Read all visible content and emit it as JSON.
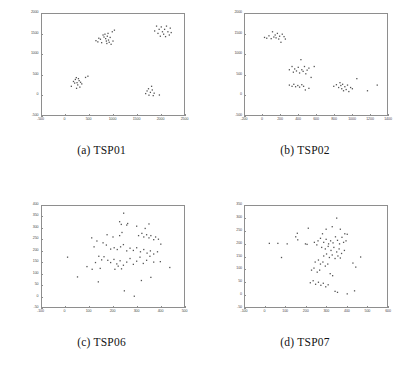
{
  "figure": {
    "background": "#ffffff",
    "point_color": "#555555",
    "frame_color": "#8e8e8e",
    "tick_label_color": "#4a4a4a"
  },
  "panels": [
    {
      "id": "a",
      "tag": "(a)",
      "name": "TSP01",
      "caption": "(a) TSP01"
    },
    {
      "id": "b",
      "tag": "(b)",
      "name": "TSP02",
      "caption": "(b) TSP02"
    },
    {
      "id": "c",
      "tag": "(c)",
      "name": "TSP06",
      "caption": "(c) TSP06"
    },
    {
      "id": "d",
      "tag": "(d)",
      "name": "TSP07",
      "caption": "(d) TSP07"
    }
  ],
  "chart_data": [
    {
      "type": "scatter",
      "title": "(a) TSP01",
      "xlabel": "",
      "ylabel": "",
      "xlim": [
        -500,
        2500
      ],
      "ylim": [
        -500,
        2000
      ],
      "xticks": [
        -500,
        0,
        500,
        1000,
        1500,
        2000,
        2500
      ],
      "yticks": [
        -500,
        0,
        500,
        1000,
        1500,
        2000
      ],
      "grid": false,
      "legend": "none",
      "n_points": 60,
      "points": [
        [
          640,
          1340
        ],
        [
          680,
          1310
        ],
        [
          700,
          1400
        ],
        [
          735,
          1375
        ],
        [
          760,
          1290
        ],
        [
          790,
          1480
        ],
        [
          810,
          1430
        ],
        [
          830,
          1500
        ],
        [
          845,
          1390
        ],
        [
          860,
          1330
        ],
        [
          870,
          1270
        ],
        [
          880,
          1450
        ],
        [
          895,
          1520
        ],
        [
          905,
          1355
        ],
        [
          920,
          1300
        ],
        [
          940,
          1420
        ],
        [
          960,
          1250
        ],
        [
          985,
          1560
        ],
        [
          1000,
          1330
        ],
        [
          1030,
          1600
        ],
        [
          1880,
          1580
        ],
        [
          1920,
          1700
        ],
        [
          1950,
          1520
        ],
        [
          1975,
          1620
        ],
        [
          2000,
          1450
        ],
        [
          2020,
          1680
        ],
        [
          2045,
          1560
        ],
        [
          2070,
          1500
        ],
        [
          2090,
          1620
        ],
        [
          2110,
          1440
        ],
        [
          2130,
          1700
        ],
        [
          2160,
          1560
        ],
        [
          2190,
          1480
        ],
        [
          2210,
          1650
        ],
        [
          2230,
          1540
        ],
        [
          120,
          210
        ],
        [
          165,
          330
        ],
        [
          190,
          290
        ],
        [
          205,
          380
        ],
        [
          225,
          425
        ],
        [
          240,
          300
        ],
        [
          255,
          245
        ],
        [
          270,
          400
        ],
        [
          285,
          350
        ],
        [
          300,
          190
        ],
        [
          315,
          310
        ],
        [
          340,
          270
        ],
        [
          420,
          430
        ],
        [
          470,
          460
        ],
        [
          230,
          160
        ],
        [
          1690,
          30
        ],
        [
          1720,
          95
        ],
        [
          1750,
          150
        ],
        [
          1760,
          -10
        ],
        [
          1790,
          60
        ],
        [
          1815,
          210
        ],
        [
          1830,
          120
        ],
        [
          1850,
          -20
        ],
        [
          1870,
          40
        ],
        [
          1980,
          -5
        ]
      ]
    },
    {
      "type": "scatter",
      "title": "(b) TSP02",
      "xlabel": "",
      "ylabel": "",
      "xlim": [
        -200,
        1400
      ],
      "ylim": [
        -500,
        2000
      ],
      "xticks": [
        -200,
        0,
        200,
        400,
        600,
        800,
        1000,
        1200,
        1400
      ],
      "yticks": [
        -500,
        0,
        500,
        1000,
        1500,
        2000
      ],
      "grid": false,
      "legend": "none",
      "n_points": 58,
      "points": [
        [
          20,
          1420
        ],
        [
          45,
          1400
        ],
        [
          70,
          1460
        ],
        [
          95,
          1390
        ],
        [
          110,
          1560
        ],
        [
          125,
          1430
        ],
        [
          140,
          1480
        ],
        [
          150,
          1410
        ],
        [
          165,
          1520
        ],
        [
          180,
          1380
        ],
        [
          190,
          1450
        ],
        [
          205,
          1300
        ],
        [
          220,
          1500
        ],
        [
          240,
          1440
        ],
        [
          255,
          1380
        ],
        [
          300,
          620
        ],
        [
          330,
          700
        ],
        [
          345,
          560
        ],
        [
          360,
          640
        ],
        [
          380,
          590
        ],
        [
          400,
          680
        ],
        [
          415,
          540
        ],
        [
          430,
          870
        ],
        [
          440,
          620
        ],
        [
          455,
          580
        ],
        [
          470,
          700
        ],
        [
          485,
          520
        ],
        [
          500,
          610
        ],
        [
          520,
          660
        ],
        [
          545,
          430
        ],
        [
          580,
          700
        ],
        [
          300,
          240
        ],
        [
          330,
          210
        ],
        [
          350,
          260
        ],
        [
          370,
          200
        ],
        [
          395,
          230
        ],
        [
          415,
          190
        ],
        [
          440,
          250
        ],
        [
          460,
          210
        ],
        [
          480,
          120
        ],
        [
          520,
          160
        ],
        [
          800,
          210
        ],
        [
          830,
          250
        ],
        [
          855,
          180
        ],
        [
          870,
          300
        ],
        [
          880,
          230
        ],
        [
          890,
          150
        ],
        [
          900,
          260
        ],
        [
          910,
          100
        ],
        [
          925,
          200
        ],
        [
          940,
          130
        ],
        [
          955,
          240
        ],
        [
          970,
          80
        ],
        [
          990,
          180
        ],
        [
          1010,
          150
        ],
        [
          1060,
          400
        ],
        [
          1180,
          100
        ],
        [
          1290,
          240
        ]
      ]
    },
    {
      "type": "scatter",
      "title": "(c) TSP06",
      "xlabel": "",
      "ylabel": "",
      "xlim": [
        -100,
        500
      ],
      "ylim": [
        -50,
        400
      ],
      "xticks": [
        -100,
        0,
        100,
        200,
        300,
        400,
        500
      ],
      "yticks": [
        -50,
        0,
        50,
        100,
        150,
        200,
        250,
        300,
        350,
        400
      ],
      "grid": false,
      "legend": "none",
      "n_points": 76,
      "points": [
        [
          245,
          368
        ],
        [
          228,
          330
        ],
        [
          235,
          318
        ],
        [
          258,
          315
        ],
        [
          262,
          322
        ],
        [
          300,
          310
        ],
        [
          352,
          320
        ],
        [
          175,
          272
        ],
        [
          200,
          262
        ],
        [
          228,
          268
        ],
        [
          238,
          282
        ],
        [
          308,
          268
        ],
        [
          322,
          278
        ],
        [
          330,
          262
        ],
        [
          342,
          272
        ],
        [
          352,
          258
        ],
        [
          360,
          268
        ],
        [
          372,
          250
        ],
        [
          380,
          262
        ],
        [
          392,
          252
        ],
        [
          336,
          300
        ],
        [
          110,
          258
        ],
        [
          132,
          244
        ],
        [
          120,
          218
        ],
        [
          158,
          236
        ],
        [
          172,
          226
        ],
        [
          190,
          208
        ],
        [
          205,
          214
        ],
        [
          218,
          206
        ],
        [
          232,
          218
        ],
        [
          244,
          228
        ],
        [
          258,
          200
        ],
        [
          272,
          212
        ],
        [
          286,
          202
        ],
        [
          300,
          214
        ],
        [
          316,
          196
        ],
        [
          330,
          206
        ],
        [
          344,
          190
        ],
        [
          358,
          200
        ],
        [
          372,
          186
        ],
        [
          388,
          196
        ],
        [
          402,
          230
        ],
        [
          8,
          172
        ],
        [
          140,
          176
        ],
        [
          152,
          160
        ],
        [
          162,
          174
        ],
        [
          178,
          158
        ],
        [
          190,
          148
        ],
        [
          204,
          162
        ],
        [
          216,
          142
        ],
        [
          230,
          156
        ],
        [
          244,
          136
        ],
        [
          258,
          150
        ],
        [
          272,
          166
        ],
        [
          286,
          140
        ],
        [
          300,
          154
        ],
        [
          314,
          172
        ],
        [
          328,
          144
        ],
        [
          342,
          158
        ],
        [
          356,
          176
        ],
        [
          372,
          150
        ],
        [
          400,
          152
        ],
        [
          440,
          126
        ],
        [
          90,
          130
        ],
        [
          112,
          118
        ],
        [
          126,
          148
        ],
        [
          146,
          122
        ],
        [
          208,
          118
        ],
        [
          222,
          132
        ],
        [
          236,
          120
        ],
        [
          50,
          84
        ],
        [
          138,
          62
        ],
        [
          248,
          22
        ],
        [
          320,
          68
        ],
        [
          360,
          82
        ],
        [
          290,
          -2
        ]
      ]
    },
    {
      "type": "scatter",
      "title": "(d) TSP07",
      "xlabel": "",
      "ylabel": "",
      "xlim": [
        -100,
        600
      ],
      "ylim": [
        -50,
        350
      ],
      "xticks": [
        -100,
        0,
        100,
        200,
        300,
        400,
        500,
        600
      ],
      "yticks": [
        -50,
        0,
        50,
        100,
        150,
        200,
        250,
        300,
        350
      ],
      "grid": false,
      "legend": "none",
      "n_points": 74,
      "points": [
        [
          352,
          302
        ],
        [
          330,
          268
        ],
        [
          300,
          258
        ],
        [
          212,
          262
        ],
        [
          282,
          240
        ],
        [
          370,
          258
        ],
        [
          392,
          240
        ],
        [
          404,
          238
        ],
        [
          150,
          228
        ],
        [
          158,
          242
        ],
        [
          160,
          216
        ],
        [
          198,
          200
        ],
        [
          242,
          206
        ],
        [
          260,
          212
        ],
        [
          272,
          222
        ],
        [
          288,
          206
        ],
        [
          300,
          218
        ],
        [
          312,
          200
        ],
        [
          322,
          212
        ],
        [
          334,
          204
        ],
        [
          346,
          228
        ],
        [
          356,
          214
        ],
        [
          366,
          200
        ],
        [
          378,
          226
        ],
        [
          386,
          206
        ],
        [
          398,
          212
        ],
        [
          20,
          202
        ],
        [
          62,
          202
        ],
        [
          108,
          200
        ],
        [
          206,
          198
        ],
        [
          254,
          196
        ],
        [
          278,
          186
        ],
        [
          296,
          180
        ],
        [
          310,
          190
        ],
        [
          324,
          174
        ],
        [
          338,
          186
        ],
        [
          352,
          168
        ],
        [
          364,
          180
        ],
        [
          376,
          162
        ],
        [
          390,
          174
        ],
        [
          80,
          146
        ],
        [
          288,
          152
        ],
        [
          302,
          160
        ],
        [
          316,
          146
        ],
        [
          330,
          156
        ],
        [
          344,
          142
        ],
        [
          358,
          152
        ],
        [
          370,
          144
        ],
        [
          470,
          148
        ],
        [
          246,
          128
        ],
        [
          262,
          136
        ],
        [
          272,
          120
        ],
        [
          284,
          128
        ],
        [
          296,
          112
        ],
        [
          308,
          120
        ],
        [
          432,
          124
        ],
        [
          446,
          108
        ],
        [
          228,
          96
        ],
        [
          240,
          104
        ],
        [
          256,
          88
        ],
        [
          268,
          96
        ],
        [
          320,
          82
        ],
        [
          332,
          74
        ],
        [
          222,
          46
        ],
        [
          236,
          54
        ],
        [
          248,
          40
        ],
        [
          262,
          48
        ],
        [
          274,
          36
        ],
        [
          286,
          44
        ],
        [
          298,
          30
        ],
        [
          310,
          38
        ],
        [
          344,
          12
        ],
        [
          356,
          8
        ],
        [
          404,
          2
        ],
        [
          440,
          14
        ]
      ]
    }
  ]
}
